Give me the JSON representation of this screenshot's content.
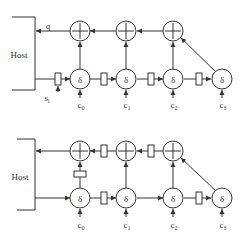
{
  "diagrams": [
    {
      "name": "systolic-array-a",
      "host_label": "Host",
      "output_label": "q",
      "input_label": "s",
      "input_sub": "i",
      "coef_labels": [
        {
          "base": "c",
          "sub": "0"
        },
        {
          "base": "c",
          "sub": "1"
        },
        {
          "base": "c",
          "sub": "2"
        },
        {
          "base": "c",
          "sub": "3"
        }
      ],
      "adder_symbol": "+",
      "cell_symbol": "δ"
    },
    {
      "name": "systolic-array-b",
      "host_label": "Host",
      "coef_labels": [
        {
          "base": "c",
          "sub": "0"
        },
        {
          "base": "c",
          "sub": "1"
        },
        {
          "base": "c",
          "sub": "2"
        },
        {
          "base": "c",
          "sub": "3"
        }
      ],
      "adder_symbol": "+",
      "cell_symbol": "δ"
    }
  ],
  "colors": {
    "stroke": "#333333",
    "background": "#ffffff"
  }
}
